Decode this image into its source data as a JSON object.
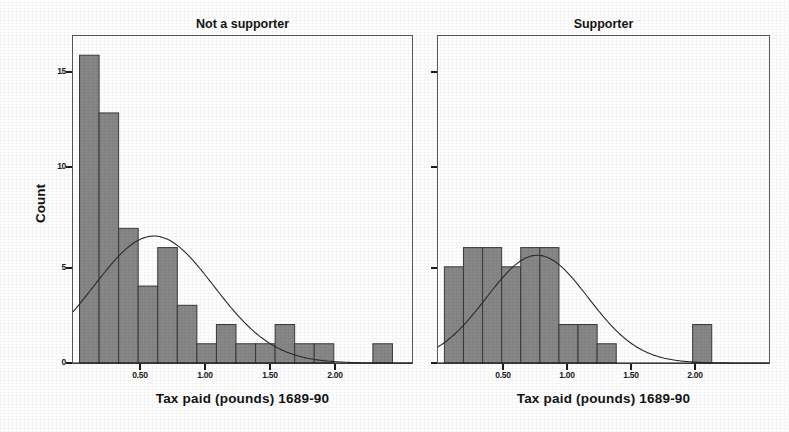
{
  "figure": {
    "background_color": "#ffffff",
    "bar_fill_color": "#878787",
    "bar_edge_color": "#3a3a3a",
    "curve_color": "#2b2b2b",
    "axis_color": "#1c1c1c",
    "y_axis_title": "Count",
    "x_axis_title": "Tax paid (pounds) 1689-90"
  },
  "chart_data": [
    {
      "type": "bar",
      "title": "Not a supporter",
      "xlabel": "Tax paid (pounds) 1689-90",
      "ylabel": "Count",
      "xlim": [
        0.0,
        2.6
      ],
      "ylim": [
        0,
        17
      ],
      "bin_width": 0.15,
      "grid": false,
      "legend": false,
      "overlay": "normal curve",
      "xticks": [
        "0.50",
        "1.00",
        "1.50",
        "2.00"
      ],
      "xtick_values": [
        0.5,
        1.0,
        1.5,
        2.0
      ],
      "yticks": [
        "0",
        "5",
        "10",
        "15"
      ],
      "ytick_values": [
        0,
        5,
        10,
        15
      ],
      "bin_starts": [
        0.05,
        0.2,
        0.35,
        0.5,
        0.65,
        0.8,
        0.95,
        1.1,
        1.25,
        1.4,
        1.55,
        1.7,
        1.85,
        2.0,
        2.15,
        2.3
      ],
      "values": [
        16,
        13,
        7,
        4,
        6,
        3,
        1,
        2,
        1,
        1,
        2,
        1,
        1,
        0,
        0,
        1
      ],
      "curve_peak_x": 0.62,
      "curve_peak_y": 6.6
    },
    {
      "type": "bar",
      "title": "Supporter",
      "xlabel": "Tax paid (pounds) 1689-90",
      "ylabel": "Count",
      "xlim": [
        0.0,
        2.6
      ],
      "ylim": [
        0,
        17
      ],
      "bin_width": 0.15,
      "grid": false,
      "legend": false,
      "overlay": "normal curve",
      "xticks": [
        "0.50",
        "1.00",
        "1.50",
        "2.00"
      ],
      "xtick_values": [
        0.5,
        1.0,
        1.5,
        2.0
      ],
      "yticks": [
        "0",
        "5",
        "10",
        "15"
      ],
      "ytick_values": [
        0,
        5,
        10,
        15
      ],
      "bin_starts": [
        0.05,
        0.2,
        0.35,
        0.5,
        0.65,
        0.8,
        0.95,
        1.1,
        1.25,
        1.4,
        1.55,
        1.7,
        1.85,
        2.0
      ],
      "values": [
        5,
        6,
        6,
        5,
        6,
        6,
        2,
        2,
        1,
        0,
        0,
        0,
        0,
        2
      ],
      "curve_peak_x": 0.78,
      "curve_peak_y": 5.6
    }
  ],
  "panels": {
    "left": {
      "title": "Not a supporter",
      "xlabel": "Tax paid (pounds) 1689-90",
      "ytick_labels": [
        "15",
        "10",
        "5",
        "0"
      ],
      "xtick_labels": [
        "0.50",
        "1.00",
        "1.50",
        "2.00"
      ]
    },
    "right": {
      "title": "Supporter",
      "xlabel": "Tax paid (pounds) 1689-90",
      "ytick_labels": [
        "",
        "",
        "",
        ""
      ],
      "xtick_labels": [
        "0.50",
        "1.00",
        "1.50",
        "2.00"
      ]
    }
  }
}
